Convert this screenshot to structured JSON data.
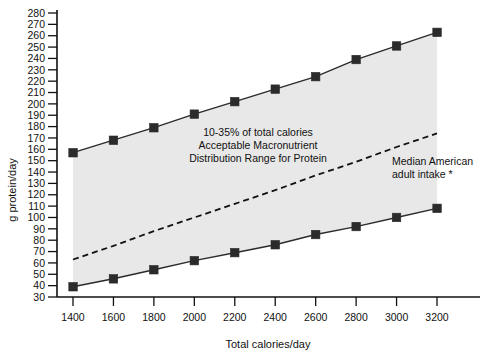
{
  "chart_data": {
    "type": "line",
    "title": "",
    "xlabel": "Total calories/day",
    "ylabel": "g protein/day",
    "x": [
      1400,
      1600,
      1800,
      2000,
      2200,
      2400,
      2600,
      2800,
      3000,
      3200
    ],
    "xticks": [
      "1400",
      "1600",
      "1800",
      "2000",
      "2200",
      "2400",
      "2600",
      "2800",
      "3000",
      "3200"
    ],
    "yticks": [
      "30",
      "40",
      "50",
      "60",
      "70",
      "80",
      "90",
      "100",
      "110",
      "120",
      "130",
      "140",
      "150",
      "160",
      "170",
      "180",
      "190",
      "200",
      "210",
      "220",
      "230",
      "240",
      "250",
      "260",
      "270",
      "280"
    ],
    "xlim": [
      1400,
      3200
    ],
    "ylim": [
      30,
      280
    ],
    "grid": false,
    "legend_position": "none",
    "series": [
      {
        "name": "35% of total calories (upper bound of AMDR)",
        "style": "solid-with-square-markers",
        "values": [
          157,
          168,
          179,
          191,
          202,
          213,
          224,
          239,
          251,
          263
        ]
      },
      {
        "name": "10% of total calories (lower bound of AMDR)",
        "style": "solid-with-square-markers",
        "values": [
          39,
          46,
          54,
          62,
          69,
          76,
          85,
          92,
          100,
          108
        ]
      },
      {
        "name": "Median American adult intake",
        "style": "dashed",
        "values": [
          63,
          75,
          88,
          100,
          112,
          124,
          137,
          149,
          162,
          174
        ]
      }
    ],
    "shaded_band": {
      "label": "Acceptable Macronutrient Distribution Range for Protein",
      "between_series": [
        0,
        1
      ],
      "color": "#e8e8e8"
    },
    "annotations": [
      {
        "name": "amdr-band-label",
        "lines": [
          "10-35% of total calories",
          "Acceptable Macronutrient",
          "Distribution Range for Protein"
        ]
      },
      {
        "name": "median-intake-label",
        "lines": [
          "Median American",
          "adult intake *"
        ]
      }
    ]
  },
  "colors": {
    "background": "#ffffff",
    "band": "#e8e8e8",
    "line": "#2b2b2b",
    "axis": "#111111"
  }
}
